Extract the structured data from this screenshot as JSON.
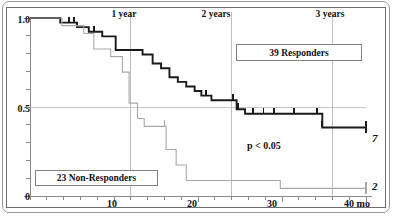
{
  "chart_data": {
    "type": "line",
    "subtype": "kaplan-meier-survival",
    "title": "",
    "xlabel": "",
    "ylabel": "",
    "xlim": [
      0,
      40
    ],
    "ylim": [
      0,
      1.0
    ],
    "grid": "vertical-year-lines-and-horizontal-0.5",
    "x_unit": "mo",
    "x_tick_labels": [
      "10",
      "20",
      "30",
      "40 mo"
    ],
    "x_tick_values": [
      10,
      20,
      30,
      40
    ],
    "x_minor_tick_step": 2,
    "y_tick_labels": [
      "1.0",
      "0.5",
      "0"
    ],
    "y_tick_values": [
      1.0,
      0.5,
      0
    ],
    "y_minor_tick_step": 0.1,
    "annotations": [
      {
        "name": "one-year",
        "text": "1 year",
        "x": 12
      },
      {
        "name": "two-years",
        "text": "2 years",
        "x": 24
      },
      {
        "name": "three-years",
        "text": "3 years",
        "x": 36
      },
      {
        "name": "p-value",
        "text": "p < 0.05",
        "x": 28,
        "y": 0.22
      }
    ],
    "series": [
      {
        "name": "39 Responders",
        "legend_label": "39 Responders",
        "color": "#1a1a1a",
        "line_width": 1.9,
        "end_label": "7",
        "n": 39,
        "steps": [
          [
            0,
            1.0
          ],
          [
            3.6,
            1.0
          ],
          [
            3.6,
            0.974
          ],
          [
            5.6,
            0.974
          ],
          [
            5.6,
            0.949
          ],
          [
            7.0,
            0.949
          ],
          [
            7.0,
            0.923
          ],
          [
            8.6,
            0.923
          ],
          [
            8.6,
            0.897
          ],
          [
            10.2,
            0.897
          ],
          [
            10.2,
            0.82
          ],
          [
            13.4,
            0.82
          ],
          [
            13.4,
            0.795
          ],
          [
            14.6,
            0.795
          ],
          [
            14.6,
            0.744
          ],
          [
            15.6,
            0.744
          ],
          [
            15.6,
            0.718
          ],
          [
            16.6,
            0.718
          ],
          [
            16.6,
            0.667
          ],
          [
            17.6,
            0.667
          ],
          [
            17.6,
            0.641
          ],
          [
            18.6,
            0.641
          ],
          [
            18.6,
            0.615
          ],
          [
            19.6,
            0.615
          ],
          [
            19.6,
            0.59
          ],
          [
            20.4,
            0.59
          ],
          [
            20.4,
            0.564
          ],
          [
            21.6,
            0.564
          ],
          [
            21.6,
            0.538
          ],
          [
            24.6,
            0.538
          ],
          [
            24.6,
            0.487
          ],
          [
            25.6,
            0.487
          ],
          [
            25.6,
            0.462
          ],
          [
            34.8,
            0.462
          ],
          [
            34.8,
            0.385
          ],
          [
            40,
            0.385
          ]
        ],
        "censor_marks": [
          4.6,
          5.2,
          7.6,
          21.0,
          24.2,
          24.8,
          26.6,
          27.8,
          29.0,
          31.4,
          34.2,
          34.8
        ]
      },
      {
        "name": "23 Non-Responders",
        "legend_label": "23 Non-Responders",
        "color": "#a8a8a8",
        "line_width": 1.1,
        "end_label": "2",
        "n": 23,
        "steps": [
          [
            0,
            1.0
          ],
          [
            3.8,
            1.0
          ],
          [
            3.8,
            0.957
          ],
          [
            6.4,
            0.957
          ],
          [
            6.4,
            0.913
          ],
          [
            7.6,
            0.913
          ],
          [
            7.6,
            0.826
          ],
          [
            9.6,
            0.826
          ],
          [
            9.6,
            0.783
          ],
          [
            11.0,
            0.783
          ],
          [
            11.0,
            0.696
          ],
          [
            11.8,
            0.696
          ],
          [
            11.8,
            0.522
          ],
          [
            12.8,
            0.522
          ],
          [
            12.8,
            0.435
          ],
          [
            13.6,
            0.435
          ],
          [
            13.6,
            0.391
          ],
          [
            16.2,
            0.391
          ],
          [
            16.2,
            0.261
          ],
          [
            17.4,
            0.261
          ],
          [
            17.4,
            0.174
          ],
          [
            18.6,
            0.174
          ],
          [
            18.6,
            0.087
          ],
          [
            29.8,
            0.087
          ],
          [
            29.8,
            0.043
          ],
          [
            40,
            0.043
          ]
        ],
        "censor_marks": [
          16.0
        ]
      }
    ]
  },
  "legends": {
    "responders": "39 Responders",
    "non_responders": "23 Non-Responders"
  },
  "axis": {
    "y_top": "1.0",
    "y_mid": "0.5",
    "y_bottom": "0",
    "x_10": "10",
    "x_20": "20",
    "x_30": "30",
    "x_40": "40 mo"
  },
  "top_markers": {
    "year1": "1 year",
    "year2": "2 years",
    "year3": "3 years"
  },
  "statistics": {
    "p_value": "p < 0.05"
  },
  "at_risk": {
    "responders_end": "7",
    "non_responders_end": "2"
  },
  "colors": {
    "responders_line": "#1a1a1a",
    "non_responders_line": "#a8a8a8",
    "axis": "#8a8a8a",
    "frame": "#6e6e6e",
    "card_border": "#9a9a9a",
    "text": "#111111"
  }
}
